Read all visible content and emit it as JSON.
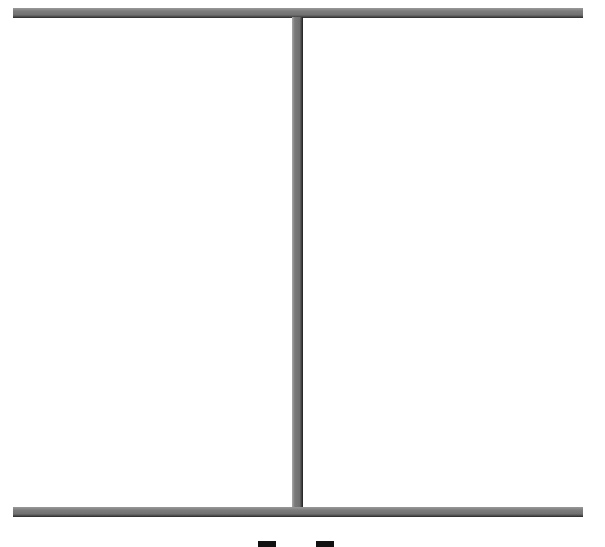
{
  "scene": {
    "background": "#ffffff",
    "walls": [
      {
        "id": "top",
        "orientation": "horizontal",
        "color": "#707070"
      },
      {
        "id": "center",
        "orientation": "vertical",
        "color": "#6e6e6e"
      },
      {
        "id": "bottom",
        "orientation": "horizontal",
        "color": "#707070"
      }
    ],
    "pieces": [
      {
        "id": "left",
        "color": "#111111"
      },
      {
        "id": "right",
        "color": "#111111"
      }
    ]
  }
}
